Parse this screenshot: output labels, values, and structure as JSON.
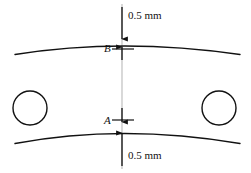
{
  "figure": {
    "type": "engineering-dimension-diagram",
    "background_color": "#ffffff",
    "line_color": "#111111",
    "centerline_color": "#b9b9b9",
    "width": 251,
    "height": 173
  },
  "labels": {
    "top_dimension": "0.5 mm",
    "bottom_dimension": "0.5 mm",
    "point_upper": "B",
    "point_lower": "A"
  },
  "geometry": {
    "centerline_x": 122,
    "top_arc": {
      "x_start": 15,
      "y_start": 54,
      "x_peak": 122,
      "y_peak": 43,
      "x_end": 240,
      "y_end": 54
    },
    "bottom_arc": {
      "x_start": 15,
      "y_start": 143,
      "x_peak": 122,
      "y_peak": 130,
      "x_end": 240,
      "y_end": 143
    },
    "circles": [
      {
        "name": "left-hole",
        "cx": 30,
        "cy": 108,
        "r": 17
      },
      {
        "name": "right-hole",
        "cx": 219,
        "cy": 108,
        "r": 17
      }
    ],
    "arrows": [
      {
        "name": "top-arrow-down",
        "x": 122,
        "y_tail": 6,
        "y_tip": 41
      },
      {
        "name": "b-arrow-up",
        "x": 122,
        "y_tail": 62,
        "y_tip": 45
      },
      {
        "name": "a-arrow-down",
        "x": 122,
        "y_tail": 104,
        "y_tip": 120
      },
      {
        "name": "bottom-arrow-up",
        "x": 122,
        "y_tail": 167,
        "y_tip": 134
      }
    ]
  }
}
